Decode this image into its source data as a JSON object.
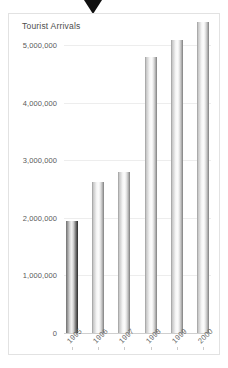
{
  "marker": {
    "name": "down-triangle-marker",
    "color": "#101010"
  },
  "chart_data": {
    "type": "bar",
    "title": "Tourist Arrivals",
    "xlabel": "",
    "ylabel": "",
    "categories": [
      "1995",
      "1996",
      "1997",
      "1998",
      "1999",
      "2000"
    ],
    "values": [
      1950000,
      2620000,
      2800000,
      4790000,
      5090000,
      5400000
    ],
    "ylim": [
      0,
      5400000
    ],
    "yticks": [
      0,
      1000000,
      2000000,
      3000000,
      4000000,
      5000000
    ],
    "ytick_labels": [
      "0",
      "1,000,000",
      "2,000,000",
      "3,000,000",
      "4,000,000",
      "5,000,000"
    ],
    "grid": true,
    "legend": "none",
    "bar_colors": [
      "#2e2e2e",
      "#7d7d7d",
      "#7d7d7d",
      "#7d7d7d",
      "#7d7d7d",
      "#7d7d7d"
    ],
    "highlighted_index": 0
  }
}
